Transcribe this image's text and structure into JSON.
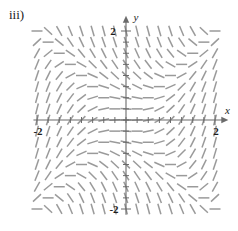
{
  "figure": {
    "part_label": "iii)",
    "type": "slope-field"
  },
  "chart_data": {
    "type": "scatter",
    "plot_kind": "slope-field",
    "title": "iii)",
    "xlabel": "x",
    "ylabel": "y",
    "xlim": [
      -2.15,
      2.15
    ],
    "ylim": [
      -2.15,
      2.15
    ],
    "grid": false,
    "axis_color": "#6b6b6b",
    "segment_color": "#9a9a9a",
    "x_tick_labels": [
      "-2",
      "2"
    ],
    "x_tick_values": [
      -2,
      2
    ],
    "y_tick_labels": [
      "2",
      "-2"
    ],
    "y_tick_values": [
      2,
      -2
    ],
    "minor_tick_count_x": 16,
    "minor_tick_count_y": 16,
    "arrow_x": "right",
    "arrow_y": "up",
    "slope_rule": "dy/dx = x^2 - y^2",
    "sample_step": 0.25,
    "sample_range": [
      -2.0,
      2.0
    ],
    "segment_length_px": 11,
    "annotations": []
  },
  "axes": {
    "x_axis_name": "x",
    "y_axis_name": "y",
    "x_left_label": "-2",
    "x_right_label": "2",
    "y_top_label": "2",
    "y_bottom_label": "-2"
  }
}
